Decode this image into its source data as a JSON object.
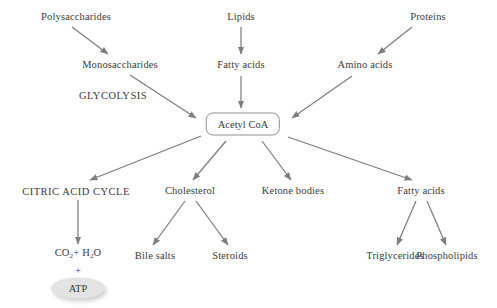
{
  "diagram": {
    "canvas": {
      "width": 497,
      "height": 308
    },
    "colors": {
      "background": "#ffffff",
      "text": "#3a3a3a",
      "arrow": "#808080",
      "box_border": "#8c8c8c",
      "atp_fill": "#e3e3e3"
    },
    "center_node": {
      "label": "Acetyl CoA",
      "x": 243,
      "y": 124
    },
    "nodes": [
      {
        "id": "polysaccharides",
        "label": "Polysaccharides",
        "x": 76,
        "y": 17,
        "style": "plain"
      },
      {
        "id": "monosaccharides",
        "label": "Monosaccharides",
        "x": 120,
        "y": 65,
        "style": "plain"
      },
      {
        "id": "glycolysis",
        "label": "GLYCOLYSIS",
        "x": 113,
        "y": 96,
        "style": "caps"
      },
      {
        "id": "lipids",
        "label": "Lipids",
        "x": 241,
        "y": 17,
        "style": "plain"
      },
      {
        "id": "fatty-acids-top",
        "label": "Fatty acids",
        "x": 241,
        "y": 65,
        "style": "plain"
      },
      {
        "id": "proteins",
        "label": "Proteins",
        "x": 428,
        "y": 17,
        "style": "plain"
      },
      {
        "id": "amino-acids",
        "label": "Amino acids",
        "x": 365,
        "y": 65,
        "style": "plain"
      },
      {
        "id": "citric-acid-cycle",
        "label": "CITRIC ACID CYCLE",
        "x": 76,
        "y": 192,
        "style": "caps"
      },
      {
        "id": "cholesterol",
        "label": "Cholesterol",
        "x": 190,
        "y": 191,
        "style": "plain"
      },
      {
        "id": "ketone-bodies",
        "label": "Ketone bodies",
        "x": 293,
        "y": 191,
        "style": "plain"
      },
      {
        "id": "fatty-acids-bottom",
        "label": "Fatty acids",
        "x": 421,
        "y": 191,
        "style": "plain"
      },
      {
        "id": "bile-salts",
        "label": "Bile salts",
        "x": 155,
        "y": 256,
        "style": "plain"
      },
      {
        "id": "steroids",
        "label": "Steroids",
        "x": 230,
        "y": 256,
        "style": "plain"
      },
      {
        "id": "triglycerides",
        "label": "Triglycerides",
        "x": 395,
        "y": 256,
        "style": "plain"
      },
      {
        "id": "phospholipids",
        "label": "Phospholipids",
        "x": 447,
        "y": 256,
        "style": "plain"
      },
      {
        "id": "co2-h2o",
        "label": "CO2+ H2O",
        "x": 78,
        "y": 254,
        "style": "formula"
      },
      {
        "id": "plus",
        "label": "+",
        "x": 78,
        "y": 270,
        "style": "plain"
      },
      {
        "id": "atp",
        "label": "ATP",
        "x": 78,
        "y": 288,
        "style": "ellipse"
      }
    ],
    "formula_parts": {
      "co2": {
        "base1": "CO",
        "sub1": "2",
        "mid": "+ H",
        "sub2": "2",
        "base2": "O"
      }
    },
    "edges": [
      {
        "id": "polysaccharides-to-monosaccharides",
        "from": "polysaccharides",
        "to": "monosaccharides",
        "x1": 72,
        "y1": 27,
        "x2": 108,
        "y2": 54
      },
      {
        "id": "monosaccharides-to-acetyl-coa",
        "from": "monosaccharides",
        "to": "acetyl-coa",
        "x1": 130,
        "y1": 75,
        "x2": 196,
        "y2": 118
      },
      {
        "id": "lipids-to-fatty-acids",
        "from": "lipids",
        "to": "fatty-acids-top",
        "x1": 241,
        "y1": 27,
        "x2": 241,
        "y2": 54
      },
      {
        "id": "fatty-acids-to-acetyl-coa",
        "from": "fatty-acids-top",
        "to": "acetyl-coa",
        "x1": 241,
        "y1": 76,
        "x2": 241,
        "y2": 108
      },
      {
        "id": "proteins-to-amino-acids",
        "from": "proteins",
        "to": "amino-acids",
        "x1": 412,
        "y1": 27,
        "x2": 378,
        "y2": 54
      },
      {
        "id": "amino-acids-to-acetyl-coa",
        "from": "amino-acids",
        "to": "acetyl-coa",
        "x1": 352,
        "y1": 76,
        "x2": 292,
        "y2": 118
      },
      {
        "id": "acetyl-coa-to-citric-acid-cycle",
        "from": "acetyl-coa",
        "to": "citric-acid-cycle",
        "x1": 201,
        "y1": 136,
        "x2": 90,
        "y2": 180
      },
      {
        "id": "acetyl-coa-to-cholesterol",
        "from": "acetyl-coa",
        "to": "cholesterol",
        "x1": 226,
        "y1": 141,
        "x2": 193,
        "y2": 180
      },
      {
        "id": "acetyl-coa-to-ketone-bodies",
        "from": "acetyl-coa",
        "to": "ketone-bodies",
        "x1": 262,
        "y1": 141,
        "x2": 291,
        "y2": 180
      },
      {
        "id": "acetyl-coa-to-fatty-acids",
        "from": "acetyl-coa",
        "to": "fatty-acids-bottom",
        "x1": 288,
        "y1": 137,
        "x2": 412,
        "y2": 180
      },
      {
        "id": "citric-acid-cycle-to-co2",
        "from": "citric-acid-cycle",
        "to": "co2-h2o",
        "x1": 78,
        "y1": 200,
        "x2": 78,
        "y2": 244
      },
      {
        "id": "cholesterol-to-bile-salts",
        "from": "cholesterol",
        "to": "bile-salts",
        "x1": 185,
        "y1": 201,
        "x2": 153,
        "y2": 245
      },
      {
        "id": "cholesterol-to-steroids",
        "from": "cholesterol",
        "to": "steroids",
        "x1": 196,
        "y1": 201,
        "x2": 228,
        "y2": 245
      },
      {
        "id": "fatty-acids-to-triglycerides",
        "from": "fatty-acids-bottom",
        "to": "triglycerides",
        "x1": 416,
        "y1": 201,
        "x2": 397,
        "y2": 245
      },
      {
        "id": "fatty-acids-to-phospholipids",
        "from": "fatty-acids-bottom",
        "to": "phospholipids",
        "x1": 427,
        "y1": 201,
        "x2": 446,
        "y2": 245
      }
    ]
  }
}
